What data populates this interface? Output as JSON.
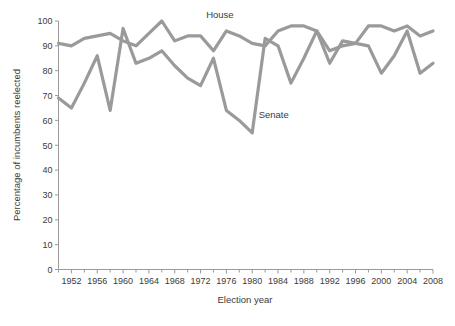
{
  "chart_data": {
    "type": "line",
    "title": "",
    "subtitle": "",
    "xlabel": "Election year",
    "ylabel": "Percentage of incumbents reelected",
    "xlim": [
      1950,
      2008
    ],
    "ylim": [
      0,
      100
    ],
    "grid": false,
    "legend_position": "inline-annotation",
    "x_major_ticks": [
      1952,
      1956,
      1960,
      1964,
      1968,
      1972,
      1976,
      1980,
      1984,
      1988,
      1992,
      1996,
      2000,
      2004,
      2008
    ],
    "x_minor_ticks": [
      1950,
      1954,
      1958,
      1962,
      1966,
      1970,
      1974,
      1978,
      1982,
      1986,
      1990,
      1994,
      1998,
      2002,
      2006
    ],
    "x_tick_labels": [
      "1952",
      "1956",
      "1960",
      "1964",
      "1968",
      "1972",
      "1976",
      "1980",
      "1984",
      "1988",
      "1992",
      "1996",
      "2000",
      "2004",
      "2008"
    ],
    "y_ticks": [
      0,
      10,
      20,
      30,
      40,
      50,
      60,
      70,
      80,
      90,
      100
    ],
    "y_tick_labels": [
      "0",
      "10",
      "20",
      "30",
      "40",
      "50",
      "60",
      "70",
      "80",
      "90",
      "100"
    ],
    "x": [
      1950,
      1952,
      1954,
      1956,
      1958,
      1960,
      1962,
      1964,
      1966,
      1968,
      1970,
      1972,
      1974,
      1976,
      1978,
      1980,
      1982,
      1984,
      1986,
      1988,
      1990,
      1992,
      1994,
      1996,
      1998,
      2000,
      2002,
      2004,
      2006,
      2008
    ],
    "series": [
      {
        "name": "House",
        "color": "#9a9a9a",
        "label_text": "House",
        "label_x": 1975,
        "label_y": 100,
        "values": [
          91,
          90,
          93,
          94,
          95,
          92,
          90,
          95,
          100,
          92,
          94,
          94,
          88,
          96,
          94,
          91,
          90,
          96,
          98,
          98,
          96,
          88,
          90,
          91,
          98,
          98,
          96,
          98,
          94,
          96
        ]
      },
      {
        "name": "Senate",
        "color": "#9a9a9a",
        "label_text": "Senate",
        "label_x": 1981,
        "label_y": 61,
        "values": [
          69,
          65,
          75,
          86,
          64,
          97,
          83,
          85,
          88,
          82,
          77,
          74,
          85,
          64,
          60,
          55,
          93,
          90,
          75,
          85,
          96,
          83,
          92,
          91,
          90,
          79,
          86,
          96,
          79,
          83
        ]
      }
    ]
  },
  "axis": {
    "x_axis_name": "election-year-axis",
    "y_axis_name": "percentage-axis"
  }
}
